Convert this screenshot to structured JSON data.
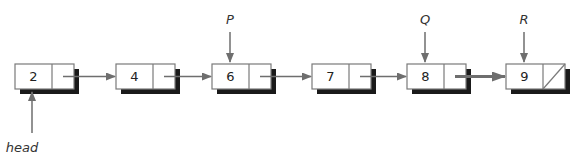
{
  "diagram": {
    "type": "linked-list",
    "colors": {
      "box_fill": "#ffffff",
      "box_stroke": "#7a7a7a",
      "shadow": "#1a1a1a",
      "arrow": "#6e6e6e",
      "text": "#222222"
    },
    "nodes": [
      {
        "value": "2",
        "x": 15,
        "next": true
      },
      {
        "value": "4",
        "x": 116,
        "next": true
      },
      {
        "value": "6",
        "x": 212,
        "next": true
      },
      {
        "value": "7",
        "x": 312,
        "next": true
      },
      {
        "value": "8",
        "x": 407,
        "next": true
      },
      {
        "value": "9",
        "x": 506,
        "next": null
      }
    ],
    "pointers": [
      {
        "label": "head",
        "target_node": 0,
        "direction": "up-from-below"
      },
      {
        "label": "P",
        "target_node": 2,
        "direction": "down-from-above"
      },
      {
        "label": "Q",
        "target_node": 4,
        "direction": "down-from-above"
      },
      {
        "label": "R",
        "target_node": 5,
        "direction": "down-from-above"
      }
    ]
  }
}
